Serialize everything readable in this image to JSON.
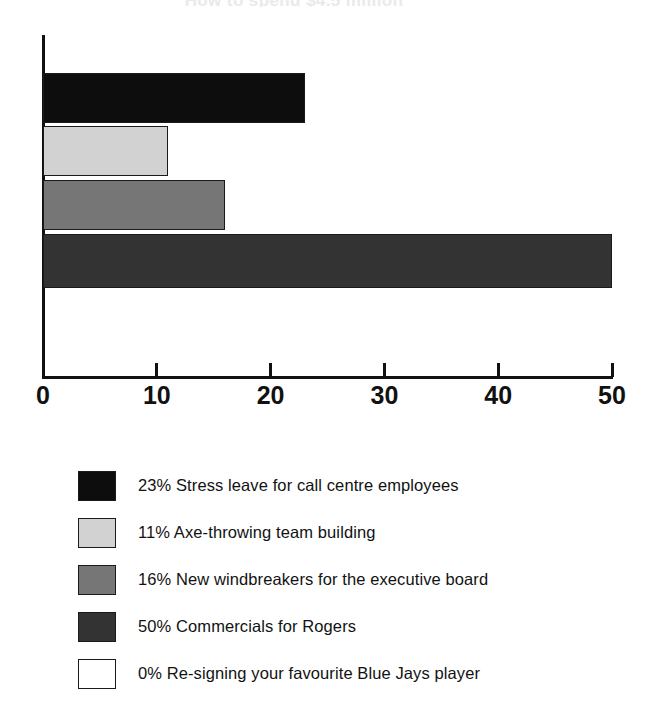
{
  "chart_data": {
    "type": "bar",
    "orientation": "horizontal",
    "title": "How to spend $4.5 million",
    "xlabel": "",
    "ylabel": "",
    "xlim": [
      0,
      50
    ],
    "grid": false,
    "legend_position": "below",
    "xticks": [
      "0",
      "10",
      "20",
      "30",
      "40",
      "50"
    ],
    "xtick_values": [
      0,
      10,
      20,
      30,
      40,
      50
    ],
    "categories": [
      "Stress leave for call centre employees",
      "Axe-throwing team building",
      "New windbreakers for the executive board",
      "Commercials for Rogers",
      "Re-signing your favourite Blue Jays player"
    ],
    "values": [
      23,
      11,
      16,
      50,
      0
    ],
    "colors": [
      "#0d0d0d",
      "#d2d2d2",
      "#767676",
      "#333333",
      "#ffffff"
    ],
    "bars": [
      {
        "value": 23,
        "percent_label": "23%",
        "color": "#0d0d0d",
        "top": 73,
        "height": 50
      },
      {
        "value": 11,
        "percent_label": "11%",
        "color": "#d2d2d2",
        "top": 126,
        "height": 50
      },
      {
        "value": 16,
        "percent_label": "16%",
        "color": "#767676",
        "top": 180,
        "height": 50
      },
      {
        "value": 50,
        "percent_label": "50%",
        "color": "#333333",
        "top": 234,
        "height": 54
      }
    ]
  },
  "legend": {
    "entries": [
      {
        "percent": "23%",
        "text": "Stress leave for call centre employees",
        "label": "23% Stress leave for call centre employees",
        "color": "#0d0d0d"
      },
      {
        "percent": "11%",
        "text": "Axe-throwing team building",
        "label": "11% Axe-throwing team building",
        "color": "#d2d2d2"
      },
      {
        "percent": "16%",
        "text": "New windbreakers for the executive board",
        "label": "16% New windbreakers for the executive board",
        "color": "#767676"
      },
      {
        "percent": "50%",
        "text": "Commercials for Rogers",
        "label": "50% Commercials for Rogers",
        "color": "#333333"
      },
      {
        "percent": "0%",
        "text": "Re-signing your favourite Blue Jays player",
        "label": "0% Re-signing your favourite Blue Jays player",
        "color": "#ffffff"
      }
    ]
  }
}
